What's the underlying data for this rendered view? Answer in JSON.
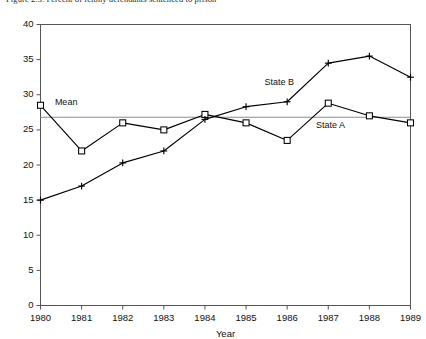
{
  "title": "Figure 2.3.  Percent of felony defendants sentenced to prison",
  "chart_data": {
    "type": "line",
    "title": "Figure 2.3.  Percent of felony defendants sentenced to prison",
    "xlabel": "Year",
    "ylabel": "",
    "x": [
      1980,
      1981,
      1982,
      1983,
      1984,
      1985,
      1986,
      1987,
      1988,
      1989
    ],
    "categories": [
      "1980",
      "1981",
      "1982",
      "1983",
      "1984",
      "1985",
      "1986",
      "1987",
      "1988",
      "1989"
    ],
    "xlim": [
      1980,
      1989
    ],
    "ylim": [
      0,
      40
    ],
    "yticks": [
      0,
      5,
      10,
      15,
      20,
      25,
      30,
      35,
      40
    ],
    "ytick_labels": [
      "0",
      "5",
      "10",
      "15",
      "20",
      "25",
      "30",
      "35",
      "40"
    ],
    "grid": false,
    "legend_position": "inline-annotation",
    "series": [
      {
        "name": "State A",
        "marker": "square",
        "label_text": "State A",
        "values": [
          28.5,
          22.0,
          26.0,
          25.0,
          27.2,
          26.0,
          23.5,
          28.8,
          27.0,
          26.0
        ]
      },
      {
        "name": "State B",
        "marker": "plus",
        "label_text": "State B",
        "values": [
          15.0,
          17.0,
          20.3,
          22.0,
          26.5,
          28.3,
          29.0,
          34.5,
          35.5,
          32.5
        ]
      }
    ],
    "reference_lines": [
      {
        "name": "Mean",
        "label": "Mean",
        "value": 26.8,
        "orientation": "horizontal",
        "color": "#8c8c8c"
      }
    ],
    "annotations": [
      {
        "text": "Mean",
        "x": 1980.35,
        "y": 28.6
      },
      {
        "text": "State B",
        "x": 1985.45,
        "y": 31.4
      },
      {
        "text": "State A",
        "x": 1986.7,
        "y": 25.3
      }
    ]
  },
  "colors": {
    "series_line": "#000000",
    "mean_line": "#8c8c8c",
    "frame": "#555555",
    "text": "#111111"
  }
}
